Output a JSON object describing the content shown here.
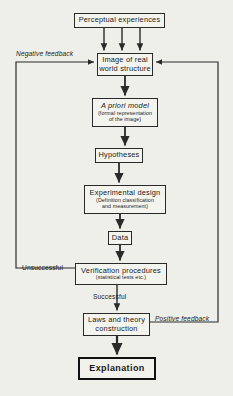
{
  "diagram": {
    "background_color": "#efefea",
    "line_color": "#2a2a2a",
    "nodes": [
      {
        "id": "perceptual",
        "label": "Perceptual experiences",
        "sub": "",
        "x": 74,
        "y": 13,
        "w": 91,
        "h": 15,
        "style": "normal"
      },
      {
        "id": "image",
        "label": "Image of real\nworld structure",
        "sub": "",
        "x": 97,
        "y": 53,
        "w": 56,
        "h": 23,
        "style": "normal"
      },
      {
        "id": "apriori",
        "label": "A priori model",
        "sub": "(formal representation\nof the image)",
        "x": 92,
        "y": 98,
        "w": 66,
        "h": 29,
        "style": "italic"
      },
      {
        "id": "hypotheses",
        "label": "Hypotheses",
        "sub": "",
        "x": 95,
        "y": 148,
        "w": 48,
        "h": 15,
        "style": "normal"
      },
      {
        "id": "experimental",
        "label": "Experimental design",
        "sub": "(Definition classification\nand measurement)",
        "x": 84,
        "y": 185,
        "w": 82,
        "h": 29,
        "style": "normal"
      },
      {
        "id": "data",
        "label": "Data",
        "sub": "",
        "x": 108,
        "y": 231,
        "w": 24,
        "h": 14,
        "style": "normal"
      },
      {
        "id": "verification",
        "label": "Verification procedures",
        "sub": "(statistical tests etc.)",
        "x": 75,
        "y": 263,
        "w": 92,
        "h": 22,
        "style": "normal"
      },
      {
        "id": "laws",
        "label": "Laws and theory\nconstruction",
        "sub": "",
        "x": 83,
        "y": 313,
        "w": 67,
        "h": 23,
        "style": "normal"
      },
      {
        "id": "explanation",
        "label": "Explanation",
        "sub": "",
        "x": 78,
        "y": 357,
        "w": 78,
        "h": 23,
        "style": "thick"
      }
    ],
    "labels": [
      {
        "id": "negative-feedback",
        "text": "Negative feedback",
        "x": 16,
        "y": 50,
        "italic": true
      },
      {
        "id": "positive-feedback",
        "text": "Positive feedback",
        "x": 155,
        "y": 315,
        "italic": true
      },
      {
        "id": "unsuccessful",
        "text": "Unsuccessful",
        "x": 22,
        "y": 264,
        "italic": false
      },
      {
        "id": "successful",
        "text": "Successful",
        "x": 102,
        "y": 294,
        "italic": false
      }
    ],
    "connectors": [
      {
        "id": "perceptual-to-image-left",
        "from": "perceptual",
        "to": "image"
      },
      {
        "id": "perceptual-to-image-center",
        "from": "perceptual",
        "to": "image"
      },
      {
        "id": "perceptual-to-image-right",
        "from": "perceptual",
        "to": "image"
      },
      {
        "id": "image-to-apriori",
        "from": "image",
        "to": "apriori"
      },
      {
        "id": "apriori-to-hypotheses",
        "from": "apriori",
        "to": "hypotheses"
      },
      {
        "id": "hypotheses-to-experimental",
        "from": "hypotheses",
        "to": "experimental"
      },
      {
        "id": "experimental-to-data",
        "from": "experimental",
        "to": "data"
      },
      {
        "id": "data-to-verification",
        "from": "data",
        "to": "verification"
      },
      {
        "id": "verification-to-laws",
        "from": "verification",
        "to": "laws"
      },
      {
        "id": "laws-to-explanation",
        "from": "laws",
        "to": "explanation"
      },
      {
        "id": "negative-feedback-loop",
        "from": "verification",
        "to": "image"
      },
      {
        "id": "positive-feedback-loop",
        "from": "laws",
        "to": "image"
      }
    ]
  }
}
